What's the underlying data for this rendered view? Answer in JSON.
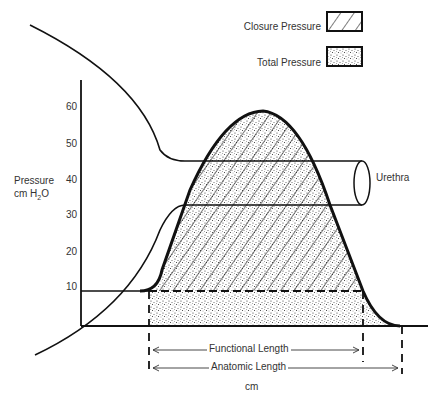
{
  "legend": {
    "closure_label": "Closure Pressure",
    "total_label": "Total Pressure"
  },
  "axis": {
    "ylabel_line1": "Pressure",
    "ylabel_line2_prefix": "cm H",
    "ylabel_line2_sub": "2",
    "ylabel_line2_suffix": "O",
    "yticks": [
      "60",
      "50",
      "40",
      "30",
      "20",
      "10"
    ],
    "xunit": "cm"
  },
  "labels": {
    "urethra": "Urethra",
    "functional_length": "Functional Length",
    "anatomic_length": "Anatomic Length"
  },
  "colors": {
    "line": "#111111",
    "fill": "#ffffff"
  }
}
